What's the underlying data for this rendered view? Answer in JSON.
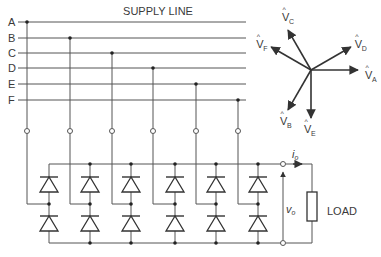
{
  "title": "SUPPLY LINE",
  "supply_lines": [
    {
      "label": "A",
      "y": 22,
      "tap_x": 27
    },
    {
      "label": "B",
      "y": 38,
      "tap_x": 70
    },
    {
      "label": "C",
      "y": 53,
      "tap_x": 112
    },
    {
      "label": "D",
      "y": 68,
      "tap_x": 153
    },
    {
      "label": "E",
      "y": 84,
      "tap_x": 196
    },
    {
      "label": "F",
      "y": 100,
      "tap_x": 238
    }
  ],
  "bridge_legs_x": [
    49,
    90,
    131,
    175,
    216,
    258
  ],
  "load": {
    "label": "LOAD",
    "current_label": "i",
    "current_sub": "o",
    "voltage_label": "v",
    "voltage_sub": "o"
  },
  "phasors": [
    {
      "name": "A",
      "label": "V",
      "sub": "A",
      "angle_deg": 0
    },
    {
      "name": "D",
      "label": "V",
      "sub": "D",
      "angle_deg": 30
    },
    {
      "name": "C",
      "label": "V",
      "sub": "C",
      "angle_deg": 120
    },
    {
      "name": "F",
      "label": "V",
      "sub": "F",
      "angle_deg": 150
    },
    {
      "name": "B",
      "label": "V",
      "sub": "B",
      "angle_deg": 240
    },
    {
      "name": "E",
      "label": "V",
      "sub": "E",
      "angle_deg": 270
    }
  ],
  "colors": {
    "wire": "#555555",
    "phasor": "#333333",
    "text": "#3a3a3a"
  }
}
